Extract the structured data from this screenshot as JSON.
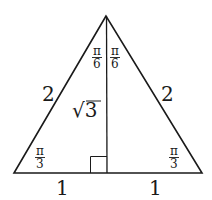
{
  "diagram": {
    "title": "",
    "type": "equilateral triangle bisected into two 30-60-90 triangles",
    "colors": {
      "stroke": "#1a1a1a",
      "background": "#ffffff"
    },
    "vertices": {
      "apex": [
        106,
        16
      ],
      "bottom_left": [
        14,
        173
      ],
      "bottom_right": [
        202,
        173
      ],
      "foot": [
        107,
        173
      ]
    },
    "labels": {
      "left_side": "2",
      "right_side": "2",
      "altitude": "√3",
      "base_left": "1",
      "base_right": "1",
      "apex_left_angle": {
        "num": "π",
        "den": "6"
      },
      "apex_right_angle": {
        "num": "π",
        "den": "6"
      },
      "bottom_left_angle": {
        "num": "π",
        "den": "3"
      },
      "bottom_right_angle": {
        "num": "π",
        "den": "3"
      }
    },
    "right_angle_marker": true
  }
}
